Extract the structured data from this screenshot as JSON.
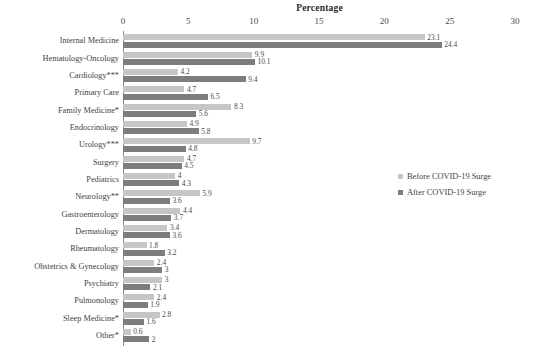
{
  "chart_data": {
    "type": "bar",
    "title": "Percentage",
    "xlabel": "Percentage",
    "ylabel": "",
    "xlim": [
      0,
      30
    ],
    "xticks": [
      0,
      5,
      10,
      15,
      20,
      25,
      30
    ],
    "xtick_labels": [
      "0",
      "5",
      "10",
      "15",
      "20",
      "25",
      "30"
    ],
    "grid": false,
    "orientation": "horizontal",
    "legend_position": "right-middle",
    "categories": [
      "Internal Medicine",
      "Hematology-Oncology",
      "Cardiology***",
      "Primary Care",
      "Family Medicine*",
      "Endocrinology",
      "Urology***",
      "Surgery",
      "Pediatrics",
      "Neurology**",
      "Gastroenterology",
      "Dermatology",
      "Rheumatology",
      "Obstetrics & Gynecology",
      "Psychiatry",
      "Pulmonology",
      "Sleep Medicine*",
      "Other*"
    ],
    "series": [
      {
        "name": "Before COVID-19 Surge",
        "color": "#c6c6c6",
        "values": [
          23.1,
          9.9,
          4.2,
          4.7,
          8.3,
          4.9,
          9.7,
          4.7,
          4,
          5.9,
          4.4,
          3.4,
          1.8,
          2.4,
          3,
          2.4,
          2.8,
          0.6
        ],
        "value_labels": [
          "23.1",
          "9.9",
          "4.2",
          "4.7",
          "8.3",
          "4.9",
          "9.7",
          "4.7",
          "4",
          "5.9",
          "4.4",
          "3.4",
          "1.8",
          "2.4",
          "3",
          "2.4",
          "2.8",
          "0.6"
        ]
      },
      {
        "name": "After COVID-19 Surge",
        "color": "#7d7d7d",
        "values": [
          24.4,
          10.1,
          9.4,
          6.5,
          5.6,
          5.8,
          4.8,
          4.5,
          4.3,
          3.6,
          3.7,
          3.6,
          3.2,
          3,
          2.1,
          1.9,
          1.6,
          2
        ],
        "value_labels": [
          "24.4",
          "10.1",
          "9.4",
          "6.5",
          "5.6",
          "5.8",
          "4.8",
          "4.5",
          "4.3",
          "3.6",
          "3.7",
          "3.6",
          "3.2",
          "3",
          "2.1",
          "1.9",
          "1.6",
          "2"
        ]
      }
    ]
  },
  "legend": {
    "items": [
      {
        "label": "Before COVID-19 Surge",
        "color": "#c6c6c6"
      },
      {
        "label": "After COVID-19 Surge",
        "color": "#7d7d7d"
      }
    ]
  }
}
